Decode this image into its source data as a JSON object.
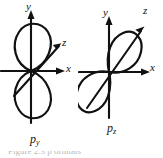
{
  "figure": {
    "type": "atomic-orbital-diagram",
    "background_color": "#ffffff",
    "ink_color": "#111111",
    "panels": [
      {
        "id": "p_y",
        "orbital_label_base": "p",
        "orbital_label_sub": "y",
        "orbital_axis": "y",
        "lobes": 2,
        "lobe_shape": "teardrop",
        "axes": [
          {
            "name": "y",
            "label": "y",
            "direction": "up"
          },
          {
            "name": "x",
            "label": "x",
            "direction": "right"
          },
          {
            "name": "z",
            "label": "z",
            "direction": "upper-right-diagonal"
          }
        ]
      },
      {
        "id": "p_z",
        "orbital_label_base": "p",
        "orbital_label_sub": "z",
        "orbital_axis": "z",
        "lobes": 2,
        "lobe_shape": "teardrop",
        "axes": [
          {
            "name": "y",
            "label": "y",
            "direction": "up"
          },
          {
            "name": "x",
            "label": "x",
            "direction": "right"
          },
          {
            "name": "z",
            "label": "z",
            "direction": "upper-right-diagonal"
          }
        ]
      }
    ]
  },
  "caption": {
    "partial_text": "Figure 2.3  p orbitals"
  }
}
